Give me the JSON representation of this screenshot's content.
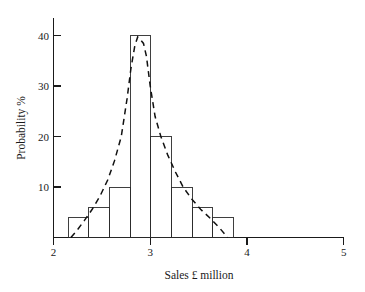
{
  "chart_data": {
    "type": "bar",
    "title": "",
    "xlabel": "Sales £ million",
    "ylabel": "Probability %",
    "xlim": [
      2,
      5
    ],
    "ylim": [
      0,
      44
    ],
    "grid": false,
    "legend": "none",
    "x_ticks": [
      2,
      3,
      4,
      5
    ],
    "x_tick_labels": [
      "2",
      "3",
      "4",
      "5"
    ],
    "y_ticks": [
      10,
      20,
      30,
      40
    ],
    "y_tick_labels": [
      "10",
      "20",
      "30",
      "40"
    ],
    "bin_edges": [
      2.15,
      2.364,
      2.578,
      2.792,
      3.006,
      3.22,
      3.434,
      3.648,
      3.862
    ],
    "categories": [
      "2.15-2.36",
      "2.36-2.58",
      "2.58-2.79",
      "2.79-3.01",
      "3.01-3.22",
      "3.22-3.43",
      "3.43-3.65",
      "3.65-3.86"
    ],
    "values": [
      4,
      6,
      10,
      40,
      20,
      10,
      6,
      4
    ],
    "series": [
      {
        "name": "Probability %",
        "values": [
          4,
          6,
          10,
          40,
          20,
          10,
          6,
          4
        ]
      },
      {
        "name": "fitted distribution curve",
        "style": "dashed",
        "x": [
          2.18,
          2.25,
          2.32,
          2.4,
          2.48,
          2.56,
          2.63,
          2.7,
          2.76,
          2.8,
          2.84,
          2.87,
          2.9,
          2.93,
          2.96,
          3.0,
          3.05,
          3.11,
          3.18,
          3.26,
          3.34,
          3.43,
          3.52,
          3.62,
          3.72,
          3.8
        ],
        "y": [
          0.0,
          1.6,
          3.4,
          5.6,
          8.2,
          11.4,
          15.2,
          20.0,
          27.5,
          33.5,
          38.0,
          39.8,
          39.2,
          38.5,
          36.0,
          30.0,
          24.0,
          20.0,
          16.4,
          13.0,
          10.0,
          7.6,
          5.6,
          3.8,
          1.8,
          0.0
        ]
      }
    ],
    "annotations": []
  },
  "labels": {
    "x_axis_title": "Sales £ million",
    "y_axis_title": "Probability %",
    "x_tick_2": "2",
    "x_tick_3": "3",
    "x_tick_4": "4",
    "x_tick_5": "5",
    "y_tick_10": "10",
    "y_tick_20": "20",
    "y_tick_30": "30",
    "y_tick_40": "40"
  },
  "colors": {
    "axis": "#1a1a1a",
    "bar_stroke": "#2a2a2a",
    "curve": "#111111",
    "background": "#ffffff"
  }
}
